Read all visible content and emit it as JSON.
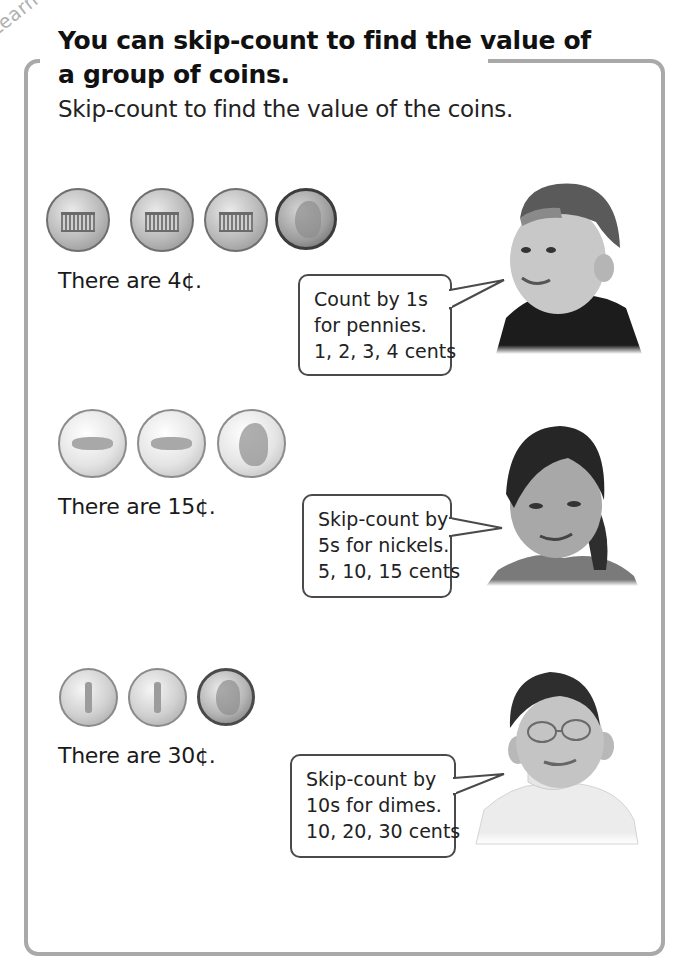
{
  "lesson": {
    "tag": "Learn",
    "title_line1": "You can skip-count to find the value of",
    "title_line2": "a group of coins.",
    "instruction": "Skip-count to find the value of the coins."
  },
  "examples": [
    {
      "coin_type": "penny",
      "coins": [
        "penny-back-icon",
        "penny-back-icon",
        "penny-back-icon",
        "penny-front-icon"
      ],
      "statement": "There are 4¢.",
      "bubble": [
        "Count by 1s",
        "for pennies.",
        "1, 2, 3, 4 cents"
      ],
      "child": "boy-with-cap-photo"
    },
    {
      "coin_type": "nickel",
      "coins": [
        "nickel-back-icon",
        "nickel-back-icon",
        "nickel-front-icon"
      ],
      "statement": "There are 15¢.",
      "bubble": [
        "Skip-count by",
        "5s for nickels.",
        "5, 10, 15 cents"
      ],
      "child": "girl-smiling-photo"
    },
    {
      "coin_type": "dime",
      "coins": [
        "dime-back-icon",
        "dime-back-icon",
        "dime-front-icon"
      ],
      "statement": "There are 30¢.",
      "bubble": [
        "Skip-count by",
        "10s for dimes.",
        "10, 20, 30 cents"
      ],
      "child": "boy-with-glasses-photo"
    }
  ],
  "colors": {
    "frame": "#a9a9a9",
    "text": "#1a1a1a",
    "bubble_border": "#4a4a4a"
  }
}
